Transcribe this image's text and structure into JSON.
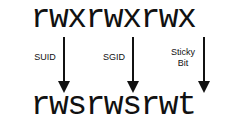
{
  "diagram": {
    "before": "rwxrwxrwx",
    "after": "rwsrwsrwt",
    "transitions": [
      {
        "label": "SUID",
        "from": "x",
        "to": "s"
      },
      {
        "label": "SGID",
        "from": "x",
        "to": "s"
      },
      {
        "label": "Sticky\nBit",
        "from": "x",
        "to": "t"
      }
    ],
    "colors": {
      "text": "#111111",
      "background": "#ffffff"
    }
  }
}
